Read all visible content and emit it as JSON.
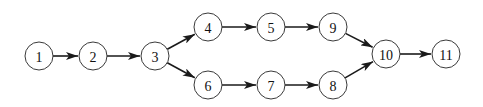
{
  "diagram": {
    "type": "directed-graph",
    "node_radius": 14,
    "colors": {
      "stroke": "#3a3a3a",
      "fill": "#ffffff",
      "edge": "#1a1a1a",
      "text": "#111111"
    },
    "nodes": [
      {
        "id": "1",
        "label": "1",
        "x": 39,
        "y": 56
      },
      {
        "id": "2",
        "label": "2",
        "x": 93,
        "y": 56
      },
      {
        "id": "3",
        "label": "3",
        "x": 155,
        "y": 56
      },
      {
        "id": "4",
        "label": "4",
        "x": 208,
        "y": 27
      },
      {
        "id": "5",
        "label": "5",
        "x": 271,
        "y": 27
      },
      {
        "id": "9",
        "label": "9",
        "x": 333,
        "y": 27
      },
      {
        "id": "6",
        "label": "6",
        "x": 208,
        "y": 85
      },
      {
        "id": "7",
        "label": "7",
        "x": 271,
        "y": 85
      },
      {
        "id": "8",
        "label": "8",
        "x": 333,
        "y": 85
      },
      {
        "id": "10",
        "label": "10",
        "x": 386,
        "y": 54
      },
      {
        "id": "11",
        "label": "11",
        "x": 446,
        "y": 54
      }
    ],
    "edges": [
      {
        "from": "1",
        "to": "2"
      },
      {
        "from": "2",
        "to": "3"
      },
      {
        "from": "3",
        "to": "4"
      },
      {
        "from": "3",
        "to": "6"
      },
      {
        "from": "4",
        "to": "5"
      },
      {
        "from": "5",
        "to": "9"
      },
      {
        "from": "9",
        "to": "10"
      },
      {
        "from": "6",
        "to": "7"
      },
      {
        "from": "7",
        "to": "8"
      },
      {
        "from": "8",
        "to": "10"
      },
      {
        "from": "10",
        "to": "11"
      }
    ]
  }
}
